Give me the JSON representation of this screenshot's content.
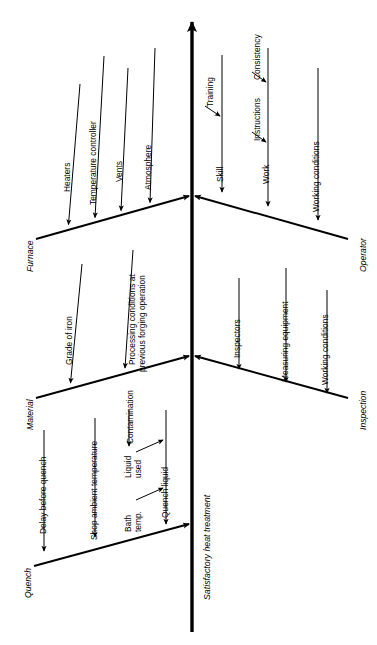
{
  "diagram": {
    "type": "fishbone-cause-and-effect",
    "orientation": "rotated-90-spine-vertical",
    "effect_label": "Satisfactory heat treatment",
    "colors": {
      "line": "#000000",
      "background": "#ffffff",
      "text": "#000000"
    },
    "categories": [
      {
        "id": "furnace",
        "label": "Furnace",
        "side": "left-upper",
        "causes": [
          {
            "label": "Heaters"
          },
          {
            "label": "Temperature controller"
          },
          {
            "label": "Vents"
          },
          {
            "label": "Atmosphere"
          }
        ]
      },
      {
        "id": "operator",
        "label": "Operator",
        "side": "right-upper",
        "causes": [
          {
            "label": "Skill",
            "sub": [
              {
                "label": "Training"
              }
            ]
          },
          {
            "label": "Work",
            "sub": [
              {
                "label": "Instructions"
              },
              {
                "label": "Consistency"
              }
            ]
          },
          {
            "label": "Working conditions"
          }
        ]
      },
      {
        "id": "material",
        "label": "Material",
        "side": "left-middle",
        "causes": [
          {
            "label": "Grade of iron"
          },
          {
            "label": "Processing conditions at",
            "label2": "previous forging operation"
          }
        ]
      },
      {
        "id": "inspection",
        "label": "Inspection",
        "side": "right-middle",
        "causes": [
          {
            "label": "Inspectors"
          },
          {
            "label": "Measuring equipment"
          },
          {
            "label": "Working conditions"
          }
        ]
      },
      {
        "id": "quench",
        "label": "Quench",
        "side": "left-lower",
        "causes": [
          {
            "label": "Delay before quench"
          },
          {
            "label": "Shop ambient temperature"
          },
          {
            "label": "Quench liquid",
            "sub": [
              {
                "label": "Liquid",
                "label2": "used",
                "sub": [
                  {
                    "label": "Contamination"
                  }
                ]
              },
              {
                "label": "Bath",
                "label2": "temp."
              }
            ]
          }
        ]
      }
    ]
  }
}
